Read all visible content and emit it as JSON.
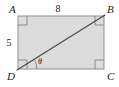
{
  "figure": {
    "kind": "rectangle-with-diagonal",
    "background_color": "#ffffff",
    "fill_color": "#dcdcdc",
    "edge_color": "#8f8f8f",
    "diagonal_color": "#4a4a4a",
    "label_color": "#1a1a1a",
    "right_angle_mark_color": "#8a8a8a"
  },
  "vertices": [
    {
      "id": "A",
      "label": "A",
      "position": "top-left",
      "x": 18,
      "y": 16
    },
    {
      "id": "B",
      "label": "B",
      "position": "top-right",
      "x": 104,
      "y": 16
    },
    {
      "id": "C",
      "label": "C",
      "position": "bottom-right",
      "x": 104,
      "y": 69
    },
    {
      "id": "D",
      "label": "D",
      "position": "bottom-left",
      "x": 18,
      "y": 69
    }
  ],
  "side_labels": [
    {
      "id": "top",
      "label": "8",
      "edge": "AB",
      "placement": "above"
    },
    {
      "id": "left",
      "label": "5",
      "edge": "AD",
      "placement": "left"
    }
  ],
  "angle_labels": [
    {
      "id": "theta",
      "label": "θ",
      "at_vertex": "D",
      "between": "DC and DB"
    }
  ],
  "segments": [
    {
      "id": "AB",
      "from": "A",
      "to": "B",
      "kind": "edge"
    },
    {
      "id": "BC",
      "from": "B",
      "to": "C",
      "kind": "edge"
    },
    {
      "id": "CD",
      "from": "C",
      "to": "D",
      "kind": "edge"
    },
    {
      "id": "DA",
      "from": "D",
      "to": "A",
      "kind": "edge"
    },
    {
      "id": "DB",
      "from": "D",
      "to": "B",
      "kind": "diagonal"
    }
  ],
  "right_angle_marks": [
    "A",
    "B",
    "C",
    "D"
  ]
}
